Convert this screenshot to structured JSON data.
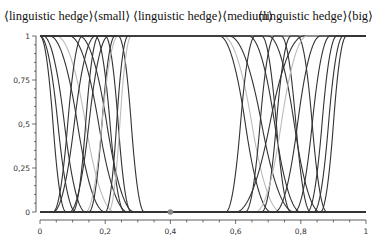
{
  "chart_data": {
    "type": "line",
    "title": "",
    "headers": [
      {
        "text": "⟨linguistic hedge⟩⟨small⟩",
        "x": 4
      },
      {
        "text": "⟨linguistic hedge⟩⟨medium⟩",
        "x": 133
      },
      {
        "text": "⟨linguistic hedge⟩⟨big⟩",
        "x": 258
      }
    ],
    "xlabel": "",
    "ylabel": "",
    "xlim": [
      0,
      1
    ],
    "ylim": [
      0,
      1
    ],
    "x_ticks": [
      "0",
      "0,2",
      "0,4",
      "0,6",
      "0,8",
      "1"
    ],
    "x_tick_values": [
      0,
      0.2,
      0.4,
      0.6,
      0.8,
      1
    ],
    "y_ticks": [
      "0",
      "0,25",
      "0,5",
      "0,75",
      "1"
    ],
    "y_tick_values": [
      0,
      0.25,
      0.5,
      0.75,
      1
    ],
    "grid": false,
    "marker": {
      "x": 0.4,
      "y": 0,
      "color": "#888888"
    },
    "series_style": {
      "dark": "#333333",
      "light": "#bbbbbb"
    },
    "series": [
      {
        "name": "small-1",
        "kind": "z",
        "a": 0.0,
        "b": 0.08,
        "shade": "dark"
      },
      {
        "name": "small-2",
        "kind": "z",
        "a": 0.0,
        "b": 0.11,
        "shade": "dark"
      },
      {
        "name": "small-3",
        "kind": "z",
        "a": 0.01,
        "b": 0.14,
        "shade": "dark"
      },
      {
        "name": "small-4",
        "kind": "z",
        "a": 0.03,
        "b": 0.2,
        "shade": "dark"
      },
      {
        "name": "small-5",
        "kind": "z",
        "a": 0.05,
        "b": 0.23,
        "shade": "light"
      },
      {
        "name": "small-6",
        "kind": "z",
        "a": 0.09,
        "b": 0.27,
        "shade": "dark"
      },
      {
        "name": "small-7",
        "kind": "z",
        "a": 0.12,
        "b": 0.29,
        "shade": "dark"
      },
      {
        "name": "small-8",
        "kind": "bell",
        "c1": 0.13,
        "c2": 0.17,
        "w": 0.09,
        "shade": "dark"
      },
      {
        "name": "small-9",
        "kind": "bell",
        "c1": 0.18,
        "c2": 0.2,
        "w": 0.08,
        "shade": "dark"
      },
      {
        "name": "small-10",
        "kind": "bell",
        "c1": 0.23,
        "c2": 0.24,
        "w": 0.08,
        "shade": "dark"
      },
      {
        "name": "small-11",
        "kind": "s",
        "a": 0.04,
        "b": 0.17,
        "shade": "dark"
      },
      {
        "name": "small-12",
        "kind": "s",
        "a": 0.09,
        "b": 0.21,
        "shade": "dark"
      },
      {
        "name": "small-13",
        "kind": "s",
        "a": 0.14,
        "b": 0.24,
        "shade": "light"
      },
      {
        "name": "medium-1",
        "kind": "trap",
        "a": 0.2,
        "b": 0.27,
        "c": 0.55,
        "d": 0.71,
        "shade": "dark"
      },
      {
        "name": "medium-2",
        "kind": "trap",
        "a": 0.21,
        "b": 0.28,
        "c": 0.56,
        "d": 0.74,
        "shade": "light"
      },
      {
        "name": "medium-3",
        "kind": "z",
        "a": 0.58,
        "b": 0.78,
        "shade": "dark"
      },
      {
        "name": "medium-4",
        "kind": "bell",
        "c1": 0.66,
        "c2": 0.68,
        "w": 0.09,
        "shade": "dark"
      },
      {
        "name": "medium-5",
        "kind": "bell",
        "c1": 0.72,
        "c2": 0.74,
        "w": 0.09,
        "shade": "dark"
      },
      {
        "name": "medium-6",
        "kind": "bell",
        "c1": 0.77,
        "c2": 0.79,
        "w": 0.09,
        "shade": "dark"
      },
      {
        "name": "medium-7",
        "kind": "z",
        "a": 0.64,
        "b": 0.8,
        "shade": "dark"
      },
      {
        "name": "medium-8",
        "kind": "z",
        "a": 0.7,
        "b": 0.86,
        "shade": "dark"
      },
      {
        "name": "big-1",
        "kind": "s",
        "a": 0.6,
        "b": 0.81,
        "shade": "dark"
      },
      {
        "name": "big-2",
        "kind": "s",
        "a": 0.66,
        "b": 0.82,
        "shade": "light"
      },
      {
        "name": "big-3",
        "kind": "s",
        "a": 0.72,
        "b": 0.86,
        "shade": "dark"
      },
      {
        "name": "big-4",
        "kind": "s",
        "a": 0.78,
        "b": 0.89,
        "shade": "dark"
      },
      {
        "name": "big-5",
        "kind": "s",
        "a": 0.82,
        "b": 0.91,
        "shade": "dark"
      },
      {
        "name": "big-6",
        "kind": "s",
        "a": 0.84,
        "b": 0.93,
        "shade": "dark"
      },
      {
        "name": "big-7",
        "kind": "s",
        "a": 0.86,
        "b": 0.94,
        "shade": "dark"
      }
    ]
  }
}
